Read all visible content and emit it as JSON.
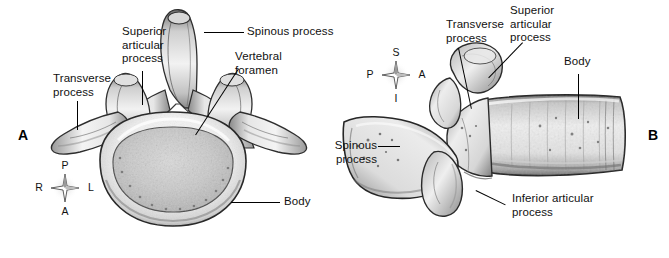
{
  "figure": {
    "background_color": "#ffffff",
    "text_color": "#111111",
    "leader_color": "#000000"
  },
  "panels": [
    {
      "letter": "A",
      "name": "superior-view",
      "view": "superior view of lumbar vertebra",
      "rosette": {
        "north": "P",
        "south": "A",
        "west": "R",
        "east": "L"
      },
      "labels": [
        {
          "name": "transverse-process",
          "text": "Transverse\nprocess"
        },
        {
          "name": "superior-articular-process",
          "text": "Superior\narticular\nprocess"
        },
        {
          "name": "spinous-process",
          "text": "Spinous process"
        },
        {
          "name": "vertebral-foramen",
          "text": "Vertebral\nforamen"
        },
        {
          "name": "body",
          "text": "Body"
        }
      ]
    },
    {
      "letter": "B",
      "name": "lateral-view",
      "view": "lateral view of lumbar vertebra",
      "rosette": {
        "north": "S",
        "south": "I",
        "west": "P",
        "east": "A"
      },
      "labels": [
        {
          "name": "transverse-process",
          "text": "Transverse\nprocess"
        },
        {
          "name": "superior-articular-process",
          "text": "Superior\narticular\nprocess"
        },
        {
          "name": "body",
          "text": "Body"
        },
        {
          "name": "spinous-process",
          "text": "Spinous\nprocess"
        },
        {
          "name": "inferior-articular-process",
          "text": "Inferior articular\nprocess"
        }
      ]
    }
  ]
}
